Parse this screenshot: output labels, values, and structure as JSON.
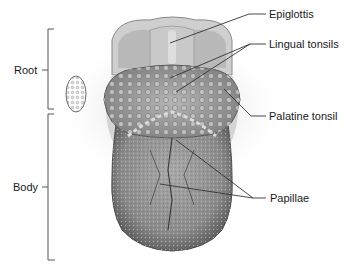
{
  "diagram": {
    "regions": [
      {
        "label": "Root"
      },
      {
        "label": "Body"
      }
    ],
    "structures": [
      {
        "label": "Epiglottis"
      },
      {
        "label": "Lingual tonsils"
      },
      {
        "label": "Palatine tonsil"
      },
      {
        "label": "Papillae"
      }
    ]
  },
  "colors": {
    "background": "#ffffff",
    "line": "#333333",
    "tissue_light": "#d9d9d9",
    "tissue_mid": "#9a9a9a",
    "tissue_dark": "#5a5a5a"
  }
}
